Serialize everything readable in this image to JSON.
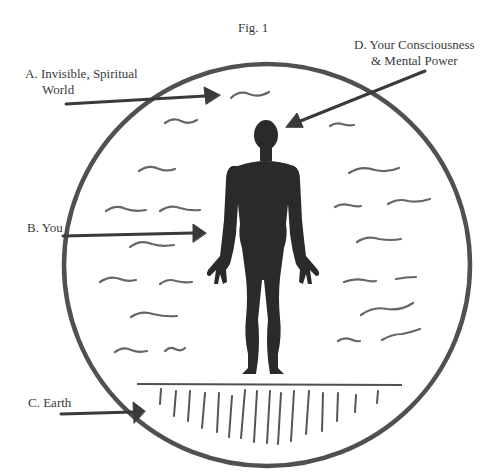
{
  "figure": {
    "title": "Fig. 1"
  },
  "labels": {
    "a": {
      "line1": "A. Invisible, Spiritual",
      "line2": "World"
    },
    "b": {
      "line1": "B. You"
    },
    "c": {
      "line1": "C. Earth"
    },
    "d": {
      "line1": "D. Your Consciousness",
      "line2": "& Mental Power"
    }
  },
  "colors": {
    "ink": "#3a3a3a",
    "circle": "#505050",
    "figure_fill": "#2a2a2a",
    "waves": "#666666",
    "background": "#ffffff"
  }
}
